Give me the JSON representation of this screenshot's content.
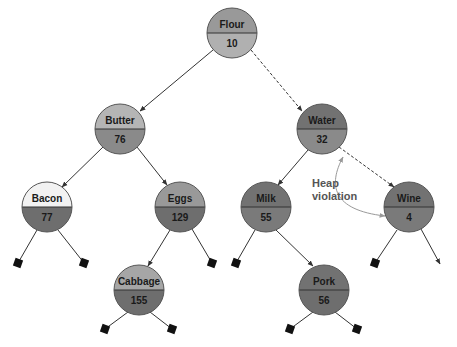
{
  "diagram": {
    "type": "binary-heap-tree",
    "annotation": {
      "line1": "Heap",
      "line2": "violation"
    },
    "colors": {
      "light_top": "#f2f2f2",
      "mid_gray": "#a6a6a6",
      "dark_gray": "#7a7a7a",
      "darker_gray": "#6e6e6e",
      "edge": "#333333",
      "annotation_arrow": "#999999"
    },
    "nodes": [
      {
        "id": "flour",
        "name": "Flour",
        "value": "10"
      },
      {
        "id": "butter",
        "name": "Butter",
        "value": "76"
      },
      {
        "id": "water",
        "name": "Water",
        "value": "32"
      },
      {
        "id": "bacon",
        "name": "Bacon",
        "value": "77"
      },
      {
        "id": "eggs",
        "name": "Eggs",
        "value": "129"
      },
      {
        "id": "milk",
        "name": "Milk",
        "value": "55"
      },
      {
        "id": "wine",
        "name": "Wine",
        "value": "4"
      },
      {
        "id": "cabbage",
        "name": "Cabbage",
        "value": "155"
      },
      {
        "id": "pork",
        "name": "Pork",
        "value": "56"
      }
    ],
    "edges": [
      {
        "from": "Flour",
        "to": "Butter",
        "style": "solid"
      },
      {
        "from": "Flour",
        "to": "Water",
        "style": "dashed"
      },
      {
        "from": "Butter",
        "to": "Bacon",
        "style": "solid"
      },
      {
        "from": "Butter",
        "to": "Eggs",
        "style": "solid"
      },
      {
        "from": "Water",
        "to": "Milk",
        "style": "solid"
      },
      {
        "from": "Water",
        "to": "Wine",
        "style": "dashed"
      },
      {
        "from": "Eggs",
        "to": "Cabbage",
        "style": "solid"
      },
      {
        "from": "Milk",
        "to": "Pork",
        "style": "solid"
      }
    ]
  }
}
